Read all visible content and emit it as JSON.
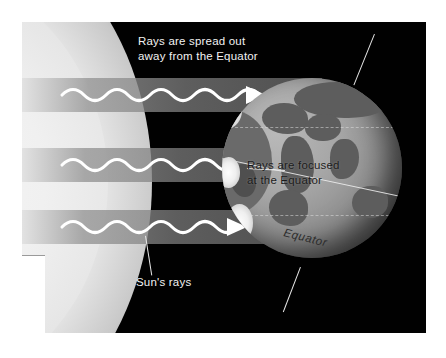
{
  "figure": {
    "kind": "science-diagram",
    "background_color": "#ffffff",
    "panel_color": "#010101"
  },
  "labels": {
    "top": "Rays are spread out\naway from the Equator",
    "middle": "Rays are focused\nat the Equator",
    "bottom": "Sun's rays",
    "equator": "Equator"
  },
  "sun": {
    "name": "Sun",
    "color": "#f2f2f2"
  },
  "globe": {
    "name": "Earth",
    "base_color": "#a6a6a6",
    "land_color": "#5d5d5d",
    "latitude_lines": 2,
    "equator_color": "#eeeeee"
  },
  "rays": {
    "count": 3,
    "beam_color": "#8a8a8a",
    "wave_color": "#ffffff",
    "arrow_direction": "right"
  }
}
